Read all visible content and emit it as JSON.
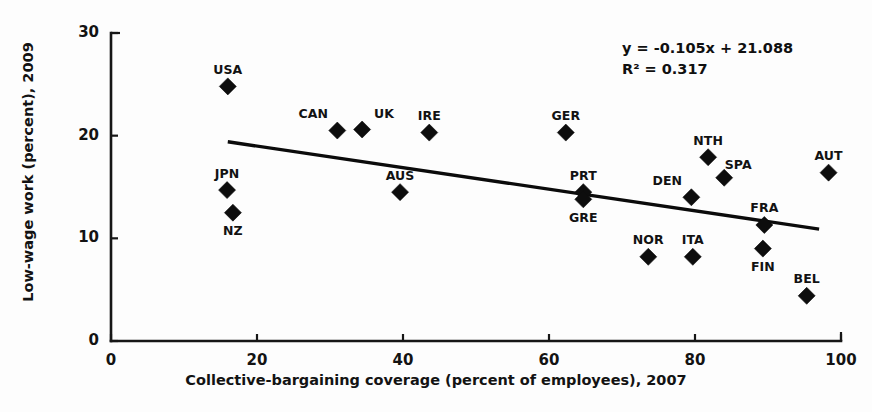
{
  "chart_data": {
    "type": "scatter",
    "title": "",
    "xlabel": "Collective-bargaining coverage (percent of employees), 2007",
    "ylabel": "Low-wage work (percent), 2009",
    "xlim": [
      0,
      100
    ],
    "ylim": [
      0,
      30
    ],
    "xticks": [
      0,
      20,
      40,
      60,
      80,
      100
    ],
    "yticks": [
      0,
      10,
      20,
      30
    ],
    "xtick_labels": [
      "0",
      "20",
      "40",
      "60",
      "80",
      "100"
    ],
    "ytick_labels": [
      "0",
      "10",
      "20",
      "30"
    ],
    "grid": false,
    "legend": "none",
    "marker_shape": "diamond",
    "marker_color": "#0d0d0d",
    "trendline": {
      "slope": -0.105,
      "intercept": 21.088,
      "r_squared": 0.317,
      "equation_text": "y = -0.105x + 21.088",
      "r2_text": "R² = 0.317",
      "x_start": 16,
      "x_end": 97,
      "color": "#0b0b0b"
    },
    "points": [
      {
        "label": "USA",
        "x": 16.0,
        "y": 24.8,
        "label_pos": "above"
      },
      {
        "label": "JPN",
        "x": 15.9,
        "y": 14.7,
        "label_pos": "above"
      },
      {
        "label": "NZ",
        "x": 16.7,
        "y": 12.5,
        "label_pos": "below"
      },
      {
        "label": "CAN",
        "x": 31.0,
        "y": 20.5,
        "label_pos": "left"
      },
      {
        "label": "UK",
        "x": 34.4,
        "y": 20.6,
        "label_pos": "right"
      },
      {
        "label": "AUS",
        "x": 39.6,
        "y": 14.5,
        "label_pos": "above"
      },
      {
        "label": "IRE",
        "x": 43.6,
        "y": 20.3,
        "label_pos": "above"
      },
      {
        "label": "GER",
        "x": 62.3,
        "y": 20.3,
        "label_pos": "above"
      },
      {
        "label": "PRT",
        "x": 64.7,
        "y": 14.5,
        "label_pos": "above"
      },
      {
        "label": "GRE",
        "x": 64.7,
        "y": 13.8,
        "label_pos": "below"
      },
      {
        "label": "NOR",
        "x": 73.6,
        "y": 8.2,
        "label_pos": "above"
      },
      {
        "label": "ITA",
        "x": 79.7,
        "y": 8.2,
        "label_pos": "above"
      },
      {
        "label": "DEN",
        "x": 79.5,
        "y": 14.0,
        "label_pos": "left"
      },
      {
        "label": "NTH",
        "x": 81.8,
        "y": 17.9,
        "label_pos": "above"
      },
      {
        "label": "SPA",
        "x": 84.0,
        "y": 15.9,
        "label_pos": "above-right"
      },
      {
        "label": "FRA",
        "x": 89.5,
        "y": 11.3,
        "label_pos": "above"
      },
      {
        "label": "FIN",
        "x": 89.3,
        "y": 9.0,
        "label_pos": "below"
      },
      {
        "label": "BEL",
        "x": 95.3,
        "y": 4.4,
        "label_pos": "above"
      },
      {
        "label": "AUT",
        "x": 98.3,
        "y": 16.4,
        "label_pos": "above"
      }
    ]
  }
}
